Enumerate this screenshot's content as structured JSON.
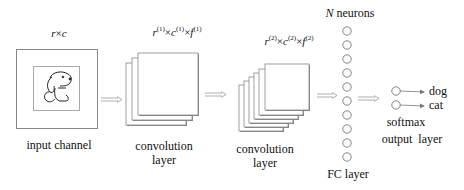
{
  "diagram": {
    "type": "cnn-architecture",
    "input": {
      "dims_label": "r×c",
      "caption": "input channel",
      "image_content": "dog-icon"
    },
    "conv1": {
      "dims_label": "r(1)×c(1)×f(1)",
      "dims_parts": {
        "r": "r",
        "c": "c",
        "f": "f",
        "sup": "(1)"
      },
      "caption_line1": "convolution",
      "caption_line2": "layer",
      "num_maps": 3
    },
    "conv2": {
      "dims_label": "r(2)×c(2)×f(2)",
      "dims_parts": {
        "r": "r",
        "c": "c",
        "f": "f",
        "sup": "(2)"
      },
      "caption_line1": "convolution",
      "caption_line2": "layer",
      "num_maps": 6
    },
    "fc": {
      "top_label_var": "N",
      "top_label_text": " neurons",
      "caption": "FC layer",
      "num_neurons": 10
    },
    "output": {
      "classes": [
        "dog",
        "cat"
      ],
      "softmax_label": "softmax",
      "caption": "output  layer"
    },
    "times": "×"
  }
}
